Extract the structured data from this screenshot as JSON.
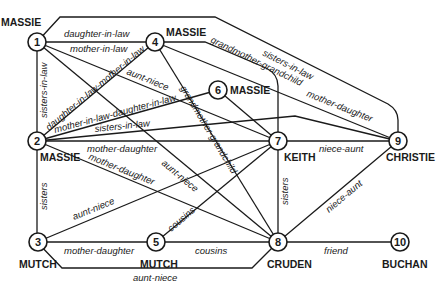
{
  "nodes": [
    {
      "id": "1",
      "label": "1",
      "name": "MASSIE"
    },
    {
      "id": "2",
      "label": "2",
      "name": "MASSIE"
    },
    {
      "id": "3",
      "label": "3",
      "name": "MUTCH"
    },
    {
      "id": "4",
      "label": "4",
      "name": "MASSIE"
    },
    {
      "id": "5",
      "label": "5",
      "name": "MUTCH"
    },
    {
      "id": "6",
      "label": "6",
      "name": "MASSIE"
    },
    {
      "id": "7",
      "label": "7",
      "name": "KEITH"
    },
    {
      "id": "8",
      "label": "8",
      "name": "CRUDEN"
    },
    {
      "id": "9",
      "label": "9",
      "name": "CHRISTIE"
    },
    {
      "id": "10",
      "label": "10",
      "name": "BUCHAN"
    }
  ],
  "edges": [
    {
      "from": "1",
      "to": "4",
      "label": "daughter-in-law"
    },
    {
      "from": "1",
      "to": "4",
      "label2": "mother-in-law",
      "label": "mother-in-law"
    },
    {
      "from": "1",
      "to": "2",
      "label": "sisters-in-law"
    },
    {
      "from": "1",
      "to": "9",
      "label": "sisters-in-law"
    },
    {
      "from": "1",
      "to": "7",
      "label": "aunt-niece"
    },
    {
      "from": "1",
      "to": "8",
      "label": "aunt-niece"
    },
    {
      "from": "4",
      "to": "2",
      "label": "daughter-in-law-mother-in-law"
    },
    {
      "from": "4",
      "to": "7",
      "label": "grandmother-grandchild"
    },
    {
      "from": "4",
      "to": "8",
      "label": "grandmother-grandchild"
    },
    {
      "from": "4",
      "to": "9",
      "label": "mother-daughter"
    },
    {
      "from": "2",
      "to": "6",
      "label": "mother-in-law-daughter-in-law"
    },
    {
      "from": "2",
      "to": "9",
      "label": "sisters-in-law"
    },
    {
      "from": "2",
      "to": "7",
      "label": "mother-daughter"
    },
    {
      "from": "2",
      "to": "8",
      "label": "mother-daughter"
    },
    {
      "from": "2",
      "to": "3",
      "label": "sisters"
    },
    {
      "from": "6",
      "to": "9",
      "label": ""
    },
    {
      "from": "3",
      "to": "7",
      "label": "aunt-niece"
    },
    {
      "from": "3",
      "to": "5",
      "label": "mother-daughter"
    },
    {
      "from": "3",
      "to": "8",
      "label": "aunt-niece"
    },
    {
      "from": "5",
      "to": "7",
      "label": "cousins"
    },
    {
      "from": "5",
      "to": "8",
      "label": "cousins"
    },
    {
      "from": "7",
      "to": "9",
      "label": "niece-aunt"
    },
    {
      "from": "7",
      "to": "8",
      "label": "sisters"
    },
    {
      "from": "8",
      "to": "9",
      "label": "niece-aunt"
    },
    {
      "from": "8",
      "to": "10",
      "label": "friend"
    }
  ]
}
